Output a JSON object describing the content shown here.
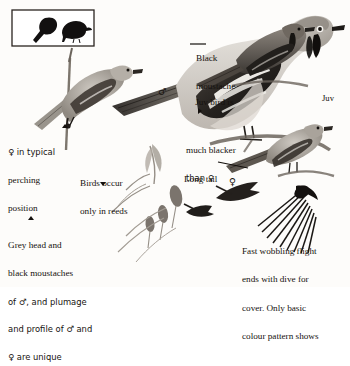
{
  "plate": {
    "title": "Bird identification plate",
    "medium": "grayscale field-guide illustration",
    "background_color": "#fdfcfa",
    "ink_color": "#14100d"
  },
  "inset": {
    "name": "silhouette-inset-box",
    "border_color": "#2a2420",
    "figures": [
      {
        "label": "perched-silhouette-tail-down",
        "fill": "#121010"
      },
      {
        "label": "perched-silhouette-upright",
        "fill": "#121010"
      }
    ]
  },
  "figures": [
    {
      "name": "main-male-perched",
      "sex_symbol": "♂",
      "description": "large male perched on branch, grey head, black moustache, white wing panel"
    },
    {
      "name": "female-perched-on-reed",
      "description": "female clinging to vertical reed stem, typical perching position"
    },
    {
      "name": "juvenile-perched",
      "sex_symbol": "",
      "description": "juvenile perched, much blacker plumage"
    },
    {
      "name": "female-long-tail-perched",
      "sex_symbol": "♀",
      "description": "female with long tail perched on stem"
    },
    {
      "name": "flight-figure-small-left",
      "description": "small bird in flight over reeds"
    },
    {
      "name": "flight-figure-diving",
      "description": "bird diving for cover"
    },
    {
      "name": "flight-figure-wing-spread",
      "description": "large spread wing showing basic colour pattern"
    },
    {
      "name": "reed-heads",
      "description": "reed seed-heads and stems"
    }
  ],
  "callouts": [
    {
      "name": "callout-black-moustache",
      "lines": [
        "Black",
        "moustache"
      ],
      "marker": "leader-line",
      "x": 196,
      "y": 41
    },
    {
      "name": "callout-juv-bird",
      "lines": [
        "Juv bird is",
        "much blacker",
        "than ♀"
      ],
      "marker": "triangle-right",
      "x": 186,
      "y": 74
    },
    {
      "name": "callout-juv-label",
      "lines": [
        "Juv"
      ],
      "marker": "none",
      "x": 322,
      "y": 80
    },
    {
      "name": "callout-long-tail",
      "lines": [
        "Long tail"
      ],
      "marker": "leader-line",
      "x": 186,
      "y": 158
    },
    {
      "name": "callout-female-perching",
      "lines": [
        "♀ in typical",
        "perching",
        "position"
      ],
      "marker": "triangle-up",
      "x": 8,
      "y": 131
    },
    {
      "name": "callout-birds-occur-reeds",
      "lines": [
        "Birds occur",
        "only in reeds"
      ],
      "marker": "triangle-down",
      "x": 80,
      "y": 163
    },
    {
      "name": "callout-grey-head-unique",
      "lines": [
        "Grey head and",
        "black moustaches",
        "of ♂, and plumage",
        "and profile of ♂ and",
        "♀ are unique"
      ],
      "marker": "triangle-up",
      "x": 8,
      "y": 224
    },
    {
      "name": "callout-flight-pattern",
      "lines": [
        "Fast wobbling flight",
        "ends with dive for",
        "cover. Only basic",
        "colour pattern shows"
      ],
      "marker": "none",
      "x": 242,
      "y": 230
    }
  ],
  "sex_markers": [
    {
      "name": "male-symbol-main-bird",
      "glyph": "♂",
      "x": 160,
      "y": 92
    },
    {
      "name": "female-symbol-long-tail",
      "glyph": "♀",
      "x": 231,
      "y": 182
    }
  ]
}
